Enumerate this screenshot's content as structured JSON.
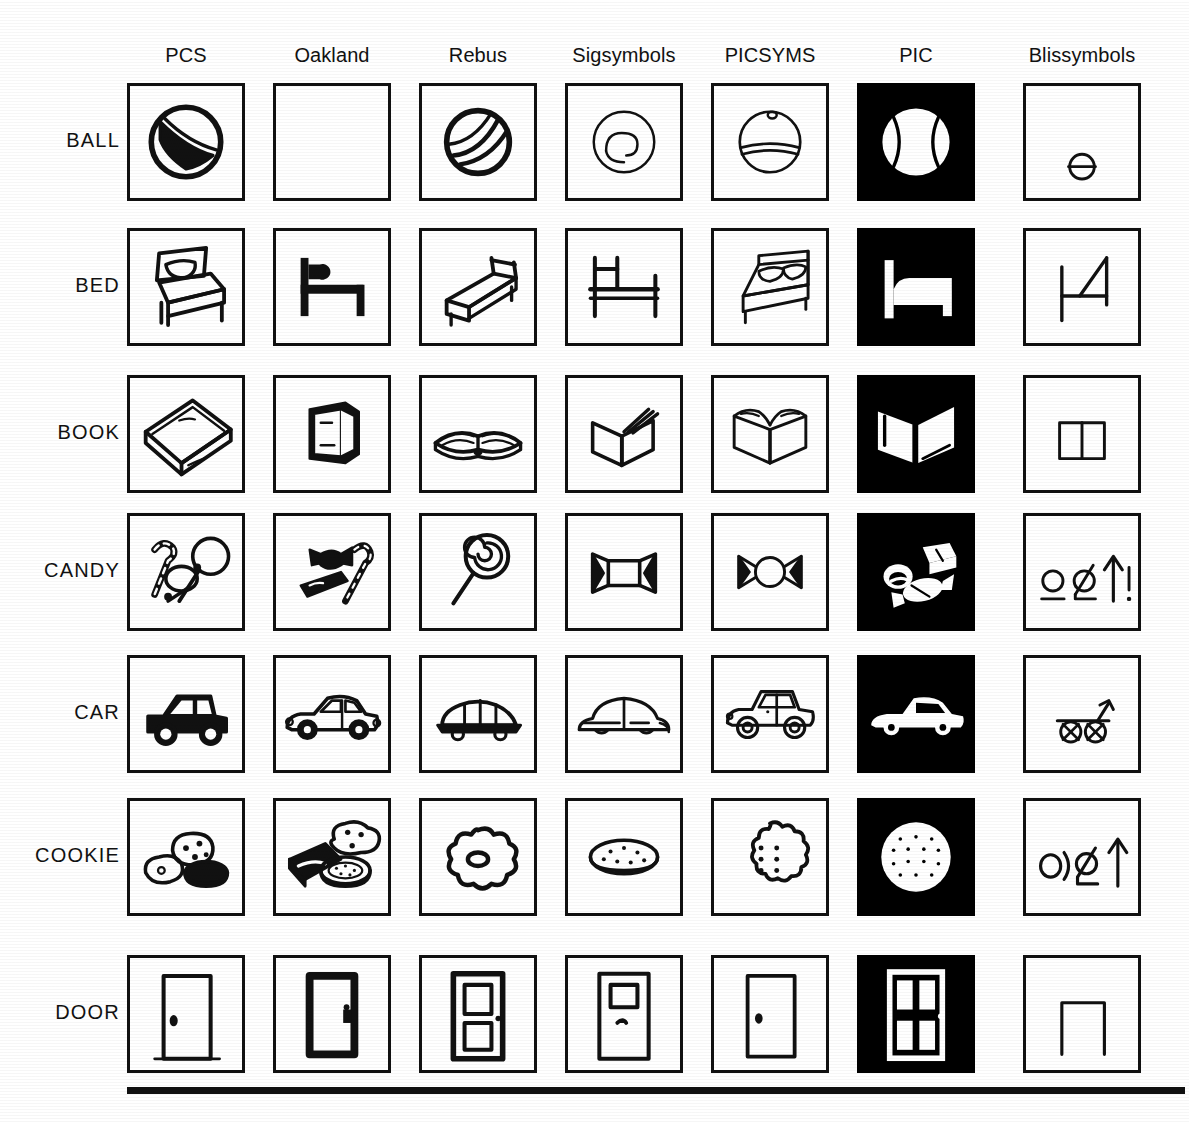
{
  "figure": {
    "type": "symbol-comparison-grid",
    "rows": 7,
    "columns": 7,
    "bottom_rule": true
  },
  "columns": [
    {
      "id": "pcs",
      "label": "PCS",
      "style": "line-art",
      "inverted": false
    },
    {
      "id": "oakland",
      "label": "Oakland",
      "style": "line-art",
      "inverted": false
    },
    {
      "id": "rebus",
      "label": "Rebus",
      "style": "line-art",
      "inverted": false
    },
    {
      "id": "sigsymbols",
      "label": "Sigsymbols",
      "style": "line-art",
      "inverted": false
    },
    {
      "id": "picsyms",
      "label": "PICSYMS",
      "style": "line-art",
      "inverted": false
    },
    {
      "id": "pic",
      "label": "PIC",
      "style": "white-on-black",
      "inverted": true
    },
    {
      "id": "blissymbols",
      "label": "Blissymbols",
      "style": "abstract-glyph",
      "inverted": false
    }
  ],
  "rows": [
    {
      "id": "ball",
      "label": "BALL"
    },
    {
      "id": "bed",
      "label": "BED"
    },
    {
      "id": "book",
      "label": "BOOK"
    },
    {
      "id": "candy",
      "label": "CANDY"
    },
    {
      "id": "car",
      "label": "CAR"
    },
    {
      "id": "cookie",
      "label": "COOKIE"
    },
    {
      "id": "door",
      "label": "DOOR"
    }
  ],
  "cells": {
    "ball": {
      "pcs": {
        "icon": "beach-ball-with-stripe",
        "empty": false
      },
      "oakland": {
        "icon": "blank",
        "empty": true
      },
      "rebus": {
        "icon": "ball-with-curved-bands",
        "empty": false
      },
      "sigsymbols": {
        "icon": "ball-swirl-outline",
        "empty": false
      },
      "picsyms": {
        "icon": "ball-with-band-and-dot",
        "empty": false
      },
      "pic": {
        "icon": "ball-white-on-black",
        "empty": false
      },
      "blissymbols": {
        "icon": "circle-with-bar",
        "empty": false
      }
    },
    "bed": {
      "pcs": {
        "icon": "bed-with-pillow-3d",
        "empty": false
      },
      "oakland": {
        "icon": "bed-side-simple",
        "empty": false
      },
      "rebus": {
        "icon": "bed-angled-frame",
        "empty": false
      },
      "sigsymbols": {
        "icon": "bed-side-outline",
        "empty": false
      },
      "picsyms": {
        "icon": "bed-with-pillows-3d",
        "empty": false
      },
      "pic": {
        "icon": "bed-white-on-black",
        "empty": false
      },
      "blissymbols": {
        "icon": "bed-h-glyph-diagonal",
        "empty": false
      }
    },
    "book": {
      "pcs": {
        "icon": "closed-book-3d",
        "empty": false
      },
      "oakland": {
        "icon": "standing-book",
        "empty": false
      },
      "rebus": {
        "icon": "open-book-with-pages",
        "empty": false
      },
      "sigsymbols": {
        "icon": "open-book-fanned-pages",
        "empty": false
      },
      "picsyms": {
        "icon": "open-book-wide",
        "empty": false
      },
      "pic": {
        "icon": "open-book-white-on-black",
        "empty": false
      },
      "blissymbols": {
        "icon": "divided-rectangle",
        "empty": false
      }
    },
    "candy": {
      "pcs": {
        "icon": "candy-cane-and-lollipops",
        "empty": false
      },
      "oakland": {
        "icon": "wrapped-candy-bar-cane",
        "empty": false
      },
      "rebus": {
        "icon": "spiral-lollipop",
        "empty": false
      },
      "sigsymbols": {
        "icon": "wrapped-candy-square",
        "empty": false
      },
      "picsyms": {
        "icon": "wrapped-candy-round",
        "empty": false
      },
      "pic": {
        "icon": "candies-white-on-black",
        "empty": false
      },
      "blissymbols": {
        "icon": "circle-phi-arrow-bang",
        "empty": false
      }
    },
    "car": {
      "pcs": {
        "icon": "car-solid-side",
        "empty": false
      },
      "oakland": {
        "icon": "sedan-side-detailed",
        "empty": false
      },
      "rebus": {
        "icon": "car-flat-side",
        "empty": false
      },
      "sigsymbols": {
        "icon": "car-beetle-outline",
        "empty": false
      },
      "picsyms": {
        "icon": "car-classic-outline",
        "empty": false
      },
      "pic": {
        "icon": "car-white-on-black",
        "empty": false
      },
      "blissymbols": {
        "icon": "cart-two-crossed-wheels",
        "empty": false
      }
    },
    "cookie": {
      "pcs": {
        "icon": "three-cookies",
        "empty": false
      },
      "oakland": {
        "icon": "cookies-and-package",
        "empty": false
      },
      "rebus": {
        "icon": "flower-cookie-with-hole",
        "empty": false
      },
      "sigsymbols": {
        "icon": "oval-cookie-speckled",
        "empty": false
      },
      "picsyms": {
        "icon": "scalloped-cookie-dots",
        "empty": false
      },
      "pic": {
        "icon": "cookie-white-on-black",
        "empty": false
      },
      "blissymbols": {
        "icon": "circle-paren-phi-arrow",
        "empty": false
      }
    },
    "door": {
      "pcs": {
        "icon": "door-with-knob",
        "empty": false
      },
      "oakland": {
        "icon": "door-thick-frame",
        "empty": false
      },
      "rebus": {
        "icon": "door-two-panels",
        "empty": false
      },
      "sigsymbols": {
        "icon": "door-with-window",
        "empty": false
      },
      "picsyms": {
        "icon": "door-plain-knob",
        "empty": false
      },
      "pic": {
        "icon": "door-four-panel-white-on-black",
        "empty": false
      },
      "blissymbols": {
        "icon": "doorway-arch",
        "empty": false
      }
    }
  },
  "colors": {
    "ink": "#111111",
    "paper": "#ffffff",
    "inverted_background": "#000000",
    "inverted_ink": "#ffffff"
  },
  "geometry": {
    "cell_width": 118,
    "cell_height": 118,
    "col_x": [
      127,
      273,
      419,
      565,
      711,
      857,
      1023
    ],
    "row_y": [
      83,
      228,
      375,
      513,
      655,
      798,
      955
    ],
    "label_x": 0,
    "header_y": 40,
    "bottom_rule_y": 1087
  }
}
